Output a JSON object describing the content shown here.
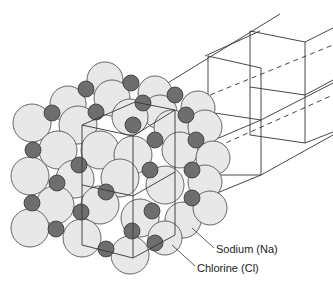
{
  "diagram": {
    "labels": {
      "sodium": "Sodium (Na)",
      "chlorine": "Chlorine (Cl)"
    },
    "colors": {
      "chlorine_fill": "#e8e8e8",
      "sodium_fill": "#6e6e6e",
      "outline": "#444444",
      "lattice_line": "#333333",
      "background": "#ffffff"
    }
  }
}
